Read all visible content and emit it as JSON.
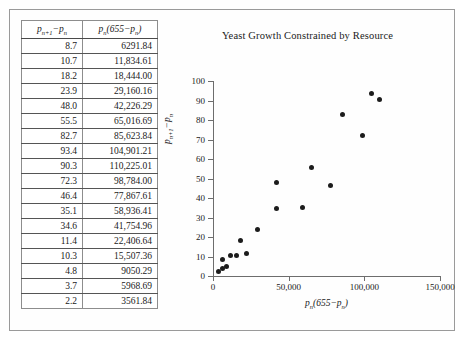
{
  "figure": {
    "table": {
      "headers": [
        "p<sub>n+1</sub> − p<sub>n</sub>",
        "p<sub>n</sub>(655 − p<sub>n</sub>)"
      ],
      "header_a_plain": "p_{n+1} - p_n",
      "header_b_plain": "p_n(655 - p_n)",
      "rows": [
        {
          "delta": "8.7",
          "product": "6291.84"
        },
        {
          "delta": "10.7",
          "product": "11,834.61"
        },
        {
          "delta": "18.2",
          "product": "18,444.00"
        },
        {
          "delta": "23.9",
          "product": "29,160.16"
        },
        {
          "delta": "48.0",
          "product": "42,226.29"
        },
        {
          "delta": "55.5",
          "product": "65,016.69"
        },
        {
          "delta": "82.7",
          "product": "85,623.84"
        },
        {
          "delta": "93.4",
          "product": "104,901.21"
        },
        {
          "delta": "90.3",
          "product": "110,225.01"
        },
        {
          "delta": "72.3",
          "product": "98,784.00"
        },
        {
          "delta": "46.4",
          "product": "77,867.61"
        },
        {
          "delta": "35.1",
          "product": "58,936.41"
        },
        {
          "delta": "34.6",
          "product": "41,754.96"
        },
        {
          "delta": "11.4",
          "product": "22,406.64"
        },
        {
          "delta": "10.3",
          "product": "15,507.36"
        },
        {
          "delta": "4.8",
          "product": "9050.29"
        },
        {
          "delta": "3.7",
          "product": "5968.69"
        },
        {
          "delta": "2.2",
          "product": "3561.84"
        }
      ]
    }
  },
  "chart_data": {
    "type": "scatter",
    "title": "Yeast Growth Constrained by Resource",
    "xlabel": "p_n(655 − p_n)",
    "ylabel": "p_{n+1} − p_n",
    "xlim": [
      0,
      150000
    ],
    "ylim": [
      0,
      100
    ],
    "xticks": [
      0,
      50000,
      100000,
      150000
    ],
    "xticklabels": [
      "0",
      "50,000",
      "100,000",
      "150,000"
    ],
    "yticks": [
      0,
      10,
      20,
      30,
      40,
      50,
      60,
      70,
      80,
      90,
      100
    ],
    "yticklabels": [
      "0",
      "10",
      "20",
      "30",
      "40",
      "50",
      "60",
      "70",
      "80",
      "90",
      "100"
    ],
    "grid": false,
    "legend": null,
    "marker": "filled-circle",
    "marker_color": "#1c1c1c",
    "x": [
      6291.84,
      11834.61,
      18444.0,
      29160.16,
      42226.29,
      65016.69,
      85623.84,
      104901.21,
      110225.01,
      98784.0,
      77867.61,
      58936.41,
      41754.96,
      22406.64,
      15507.36,
      9050.29,
      5968.69,
      3561.84
    ],
    "y": [
      8.7,
      10.7,
      18.2,
      23.9,
      48.0,
      55.5,
      82.7,
      93.4,
      90.3,
      72.3,
      46.4,
      35.1,
      34.6,
      11.4,
      10.3,
      4.8,
      3.7,
      2.2
    ]
  }
}
